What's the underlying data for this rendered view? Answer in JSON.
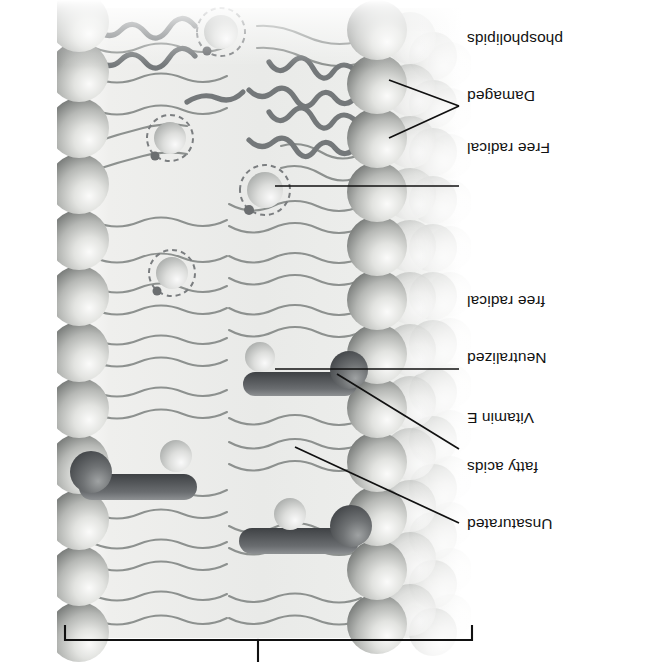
{
  "figure": {
    "title_region": "lipid-bilayer-membrane-cross-section",
    "orientation_note": "rotated-180",
    "background_color": "#ffffff",
    "ink_color": "#121212",
    "membrane_tone": "#b9bcbd",
    "head_light": "#f2f2f1",
    "head_mid": "#c9cac7",
    "head_dark": "#6f7270",
    "tail_color": "#8b8f8d",
    "damaged_tail_color": "#6e716f",
    "vitamin_e_color": "#55585a"
  },
  "bracket": {
    "name": "membrane-extent-bracket",
    "left_x": 185,
    "right_x": 592,
    "y": 22,
    "tick_x": 399,
    "tick_top": 0
  },
  "labels": [
    {
      "id": "unsaturated-fatty-acids",
      "lines": [
        "Unsaturated",
        "fatty acids"
      ],
      "text": "Unsaturated fatty acids",
      "x": 28,
      "y": 92,
      "align": "right",
      "leader": "diagonal"
    },
    {
      "id": "vitamin-e",
      "lines": [
        "Vitamin E"
      ],
      "text": "Vitamin E",
      "x": 28,
      "y": 198,
      "align": "right",
      "leader": "diagonal"
    },
    {
      "id": "neutralized-free-radical",
      "lines": [
        "Neutralized",
        "free radical"
      ],
      "text": "Neutralized free radical",
      "x": 28,
      "y": 258,
      "align": "right",
      "leader": "horizontal"
    },
    {
      "id": "free-radical",
      "lines": [
        "Free radical"
      ],
      "text": "Free radical",
      "x": 28,
      "y": 462,
      "align": "right",
      "leader": "horizontal"
    },
    {
      "id": "damaged-phospholipids",
      "lines": [
        "Damaged",
        "phospholipids"
      ],
      "text": "Damaged phospholipids",
      "x": 28,
      "y": 516,
      "align": "right",
      "leader": "fork"
    }
  ],
  "label_text": {
    "unsaturated_l1": "Unsaturated",
    "unsaturated_l2": "fatty acids",
    "vitamin_e": "Vitamin E",
    "neutralized_l1": "Neutralized",
    "neutralized_l2": "free radical",
    "free_radical": "Free radical",
    "damaged_l1": "Damaged",
    "damaged_l2": "phospholipids"
  },
  "structures": {
    "phospholipid_head_count_left_front": 12,
    "phospholipid_head_count_right": 11,
    "vitamin_e_molecules": 2,
    "free_radicals": 4,
    "neutralized_free_radicals": 2,
    "damaged_phospholipid_clusters": 3,
    "leaflets": 2
  }
}
